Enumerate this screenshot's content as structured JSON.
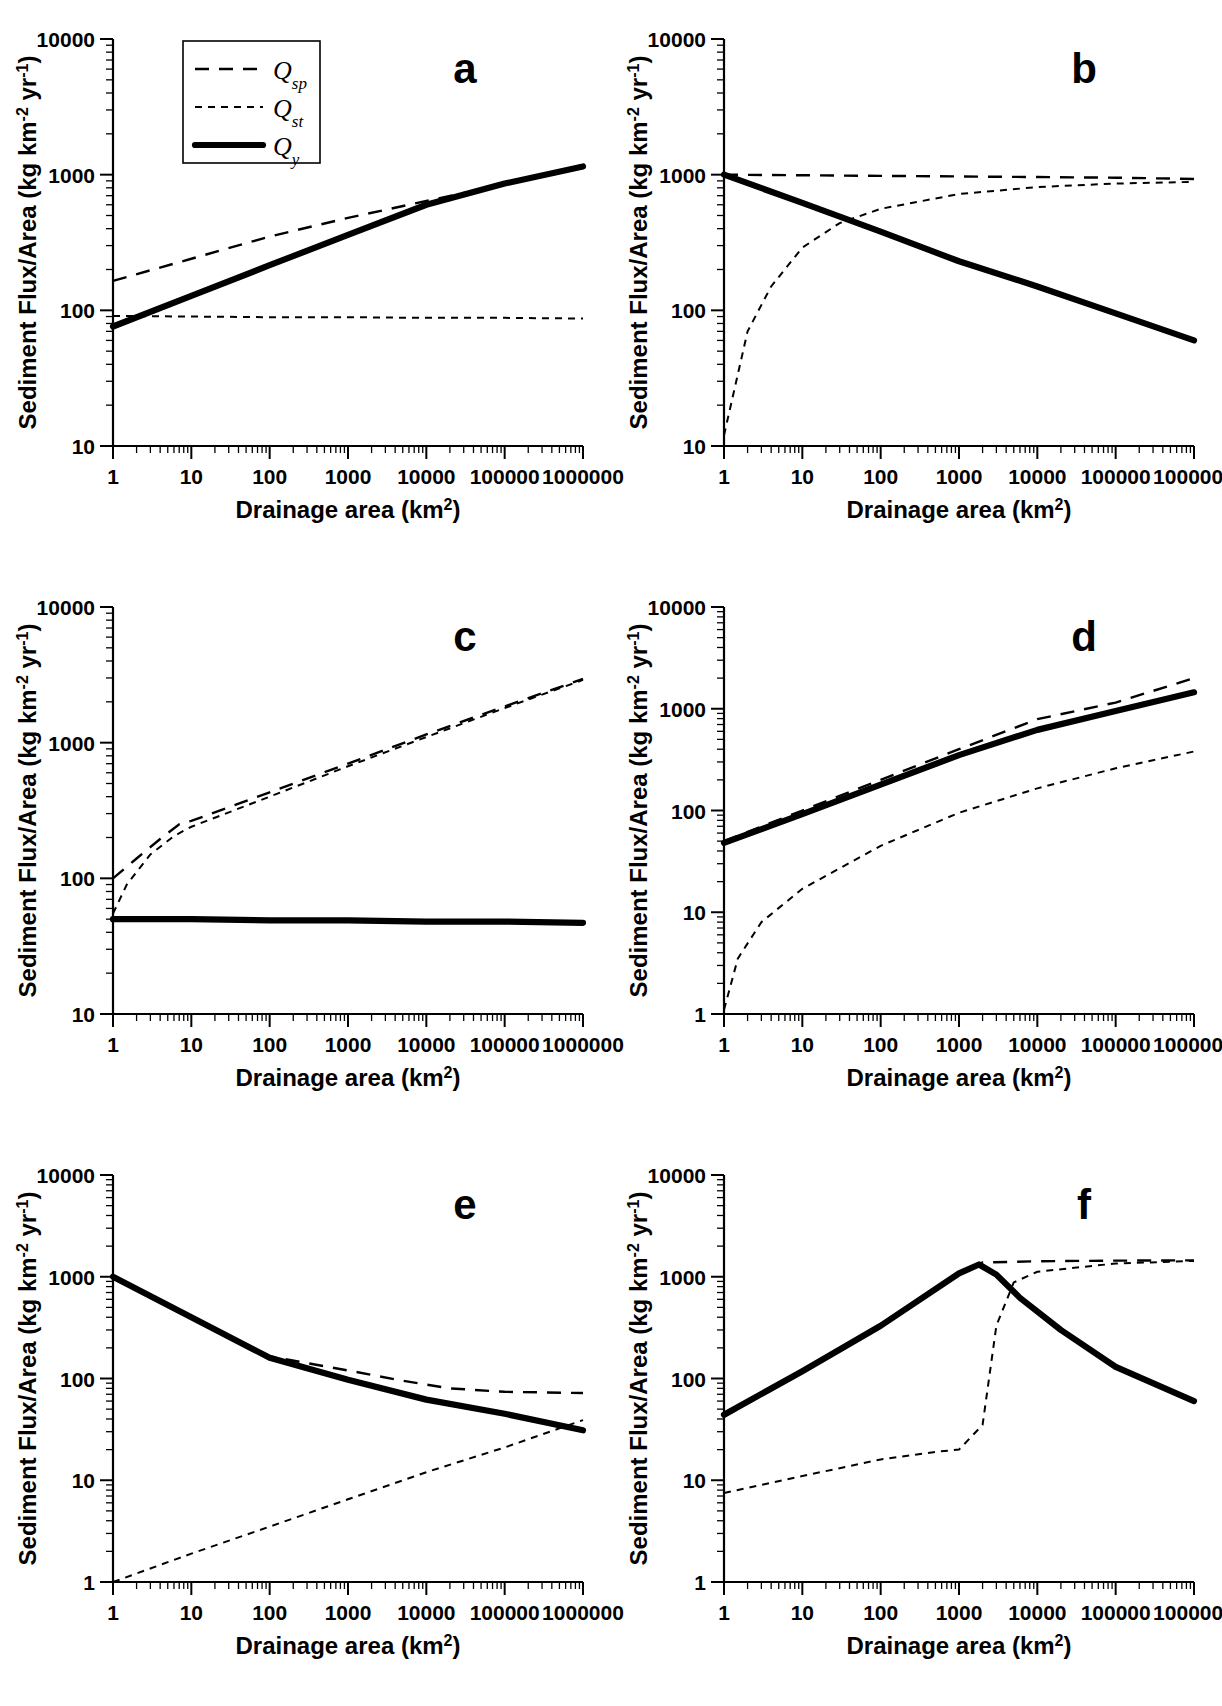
{
  "figure": {
    "axis_titles": {
      "x": "Drainage area (km",
      "x_exp": "2",
      "x_close": ")",
      "y_main": "Sediment Flux/Area (kg km",
      "y_exp1": "-2",
      "y_mid": " yr",
      "y_exp2": "-1",
      "y_close": ")"
    },
    "legend": {
      "entries": [
        {
          "key": "Q",
          "sub": "sp",
          "style": "long-dash",
          "name": "Qsp"
        },
        {
          "key": "Q",
          "sub": "st",
          "style": "short-dash",
          "name": "Qst"
        },
        {
          "key": "Q",
          "sub": "y",
          "style": "solid-thick",
          "name": "Qy"
        }
      ]
    },
    "panels": [
      "a",
      "b",
      "c",
      "d",
      "e",
      "f"
    ]
  },
  "chart_data": [
    {
      "id": "a",
      "type": "line",
      "title": "a",
      "xlabel": "Drainage area (km2)",
      "ylabel": "Sediment Flux/Area (kg km-2 yr-1)",
      "xscale": "log",
      "yscale": "log",
      "xlim": [
        1,
        1000000
      ],
      "ylim": [
        10,
        10000
      ],
      "xticks": [
        1,
        10,
        100,
        1000,
        10000,
        100000,
        1000000
      ],
      "yticks": [
        10,
        100,
        1000,
        10000
      ],
      "grid": false,
      "legend_position": "upper-left",
      "series": [
        {
          "name": "Qsp",
          "style": "long-dash",
          "x": [
            1,
            10,
            100,
            1000,
            10000,
            100000,
            1000000
          ],
          "y": [
            165,
            240,
            350,
            480,
            640,
            850,
            1180
          ]
        },
        {
          "name": "Qst",
          "style": "short-dash",
          "x": [
            1,
            10,
            100,
            1000,
            10000,
            100000,
            1000000
          ],
          "y": [
            91,
            90,
            89,
            89,
            88,
            88,
            87
          ]
        },
        {
          "name": "Qy",
          "style": "solid-thick",
          "x": [
            1,
            10,
            100,
            1000,
            10000,
            100000,
            1000000
          ],
          "y": [
            76,
            128,
            215,
            360,
            600,
            860,
            1150
          ]
        }
      ]
    },
    {
      "id": "b",
      "type": "line",
      "title": "b",
      "xlabel": "Drainage area (km2)",
      "ylabel": "Sediment Flux/Area (kg km-2 yr-1)",
      "xscale": "log",
      "yscale": "log",
      "xlim": [
        1,
        1000000
      ],
      "ylim": [
        10,
        10000
      ],
      "xticks": [
        1,
        10,
        100,
        1000,
        10000,
        100000,
        1000000
      ],
      "yticks": [
        10,
        100,
        1000,
        10000
      ],
      "grid": false,
      "series": [
        {
          "name": "Qsp",
          "style": "long-dash",
          "x": [
            1,
            10,
            100,
            1000,
            10000,
            100000,
            1000000
          ],
          "y": [
            1000,
            990,
            980,
            970,
            960,
            950,
            930
          ]
        },
        {
          "name": "Qst",
          "style": "short-dash",
          "x": [
            1,
            2,
            4,
            10,
            30,
            100,
            1000,
            10000,
            100000,
            1000000
          ],
          "y": [
            12,
            70,
            150,
            290,
            440,
            560,
            720,
            810,
            860,
            885
          ]
        },
        {
          "name": "Qy",
          "style": "solid-thick",
          "x": [
            1,
            10,
            100,
            1000,
            10000,
            100000,
            1000000
          ],
          "y": [
            1000,
            620,
            380,
            230,
            150,
            95,
            60
          ]
        }
      ]
    },
    {
      "id": "c",
      "type": "line",
      "title": "c",
      "xlabel": "Drainage area (km2)",
      "ylabel": "Sediment Flux/Area (kg km-2 yr-1)",
      "xscale": "log",
      "yscale": "log",
      "xlim": [
        1,
        1000000
      ],
      "ylim": [
        10,
        10000
      ],
      "xticks": [
        1,
        10,
        100,
        1000,
        10000,
        100000,
        1000000
      ],
      "yticks": [
        10,
        100,
        1000,
        10000
      ],
      "grid": false,
      "series": [
        {
          "name": "Qsp",
          "style": "long-dash",
          "x": [
            1,
            2,
            4,
            7,
            10,
            100,
            1000,
            10000,
            100000,
            1000000
          ],
          "y": [
            100,
            140,
            195,
            250,
            265,
            430,
            700,
            1150,
            1850,
            2950
          ]
        },
        {
          "name": "Qst",
          "style": "short-dash",
          "x": [
            1,
            1.5,
            3,
            6,
            10,
            100,
            1000,
            10000,
            100000,
            1000000
          ],
          "y": [
            55,
            90,
            150,
            205,
            240,
            400,
            670,
            1100,
            1800,
            2900
          ]
        },
        {
          "name": "Qy",
          "style": "solid-thick",
          "x": [
            1,
            10,
            100,
            1000,
            10000,
            100000,
            1000000
          ],
          "y": [
            50,
            50,
            49,
            49,
            48,
            48,
            47
          ]
        }
      ]
    },
    {
      "id": "d",
      "type": "line",
      "title": "d",
      "xlabel": "Drainage area (km2)",
      "ylabel": "Sediment Flux/Area (kg km-2 yr-1)",
      "xscale": "log",
      "yscale": "log",
      "xlim": [
        1,
        1000000
      ],
      "ylim": [
        1,
        10000
      ],
      "xticks": [
        1,
        10,
        100,
        1000,
        10000,
        100000,
        1000000
      ],
      "yticks": [
        1,
        10,
        100,
        1000,
        10000
      ],
      "grid": false,
      "series": [
        {
          "name": "Qsp",
          "style": "long-dash",
          "x": [
            1,
            10,
            100,
            1000,
            10000,
            100000,
            1000000
          ],
          "y": [
            50,
            100,
            200,
            400,
            790,
            1150,
            2000
          ]
        },
        {
          "name": "Qst",
          "style": "short-dash",
          "x": [
            1,
            1.5,
            3,
            10,
            100,
            1000,
            10000,
            100000,
            1000000
          ],
          "y": [
            1.1,
            3.5,
            8,
            17,
            45,
            95,
            165,
            260,
            380
          ]
        },
        {
          "name": "Qy",
          "style": "solid-thick",
          "x": [
            1,
            10,
            100,
            1000,
            10000,
            100000,
            1000000
          ],
          "y": [
            48,
            92,
            180,
            350,
            620,
            950,
            1450
          ]
        }
      ]
    },
    {
      "id": "e",
      "type": "line",
      "title": "e",
      "xlabel": "Drainage area (km2)",
      "ylabel": "Sediment Flux/Area (kg km-2 yr-1)",
      "xscale": "log",
      "yscale": "log",
      "xlim": [
        1,
        1000000
      ],
      "ylim": [
        1,
        10000
      ],
      "xticks": [
        1,
        10,
        100,
        1000,
        10000,
        100000,
        1000000
      ],
      "yticks": [
        1,
        10,
        100,
        1000,
        10000
      ],
      "grid": false,
      "series": [
        {
          "name": "Qsp",
          "style": "long-dash",
          "x": [
            1,
            10,
            100,
            1000,
            5000,
            20000,
            100000,
            1000000
          ],
          "y": [
            1000,
            400,
            165,
            120,
            95,
            80,
            74,
            72
          ]
        },
        {
          "name": "Qst",
          "style": "short-dash",
          "x": [
            1,
            10,
            100,
            1000,
            10000,
            100000,
            1000000
          ],
          "y": [
            1.0,
            1.9,
            3.5,
            6.5,
            12,
            21,
            39
          ]
        },
        {
          "name": "Qy",
          "style": "solid-thick",
          "x": [
            1,
            10,
            100,
            1000,
            10000,
            100000,
            1000000
          ],
          "y": [
            1000,
            400,
            160,
            97,
            62,
            45,
            31
          ]
        }
      ]
    },
    {
      "id": "f",
      "type": "line",
      "title": "f",
      "xlabel": "Drainage area (km2)",
      "ylabel": "Sediment Flux/Area (kg km-2 yr-1)",
      "xscale": "log",
      "yscale": "log",
      "xlim": [
        1,
        1000000
      ],
      "ylim": [
        1,
        10000
      ],
      "xticks": [
        1,
        10,
        100,
        1000,
        10000,
        100000,
        1000000
      ],
      "yticks": [
        1,
        10,
        100,
        1000,
        10000
      ],
      "grid": false,
      "series": [
        {
          "name": "Qsp",
          "style": "long-dash",
          "x": [
            1,
            10,
            100,
            1000,
            2000,
            10000,
            100000,
            1000000
          ],
          "y": [
            42,
            115,
            330,
            1080,
            1380,
            1420,
            1440,
            1450
          ]
        },
        {
          "name": "Qst",
          "style": "short-dash",
          "x": [
            1,
            10,
            100,
            500,
            1000,
            2000,
            3000,
            5000,
            10000,
            100000,
            1000000
          ],
          "y": [
            7.5,
            11,
            16,
            19,
            20,
            35,
            330,
            880,
            1120,
            1350,
            1430
          ]
        },
        {
          "name": "Qy",
          "style": "solid-thick",
          "x": [
            1,
            10,
            100,
            1000,
            1800,
            3000,
            6000,
            20000,
            100000,
            1000000
          ],
          "y": [
            44,
            118,
            330,
            1080,
            1320,
            1050,
            620,
            300,
            130,
            60
          ]
        }
      ]
    }
  ]
}
